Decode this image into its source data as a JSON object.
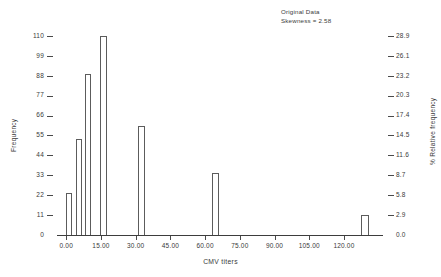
{
  "chart_data": {
    "type": "bar",
    "title": "",
    "annotation": {
      "line1": "Original Data",
      "line2": "Skewness = 2.58"
    },
    "xlabel": "CMV titers",
    "ylabel": "Frequency",
    "ylabel_right": "% Relative frequency",
    "xlim": [
      -4,
      136
    ],
    "ylim": [
      0,
      115.5
    ],
    "grid": false,
    "legend": null,
    "bar_edge_color": "#5c5c5c",
    "bar_fill_color": "#ffffff",
    "axis_color": "#3d3d3d",
    "text_color": "#3a3a3a",
    "x_ticks": [
      {
        "value": 0,
        "label": "0.00"
      },
      {
        "value": 15,
        "label": "15.00"
      },
      {
        "value": 30,
        "label": "30.00"
      },
      {
        "value": 45,
        "label": "45.00"
      },
      {
        "value": 60,
        "label": "60.00"
      },
      {
        "value": 75,
        "label": "75.00"
      },
      {
        "value": 90,
        "label": "90.00"
      },
      {
        "value": 105,
        "label": "105.00"
      },
      {
        "value": 120,
        "label": "120.00"
      }
    ],
    "y_ticks_left": [
      {
        "value": 0,
        "label": "0"
      },
      {
        "value": 11,
        "label": "11"
      },
      {
        "value": 22,
        "label": "22"
      },
      {
        "value": 33,
        "label": "33"
      },
      {
        "value": 44,
        "label": "44"
      },
      {
        "value": 55,
        "label": "55"
      },
      {
        "value": 66,
        "label": "66"
      },
      {
        "value": 77,
        "label": "77"
      },
      {
        "value": 88,
        "label": "88"
      },
      {
        "value": 99,
        "label": "99"
      },
      {
        "value": 110,
        "label": "110"
      }
    ],
    "y_ticks_right": [
      {
        "value": 0,
        "label": "0.0"
      },
      {
        "value": 11,
        "label": "2.9"
      },
      {
        "value": 22,
        "label": "5.8"
      },
      {
        "value": 33,
        "label": "8.7"
      },
      {
        "value": 44,
        "label": "11.6"
      },
      {
        "value": 55,
        "label": "14.5"
      },
      {
        "value": 66,
        "label": "17.4"
      },
      {
        "value": 77,
        "label": "20.3"
      },
      {
        "value": 88,
        "label": "23.2"
      },
      {
        "value": 99,
        "label": "26.1"
      },
      {
        "value": 110,
        "label": "28.9"
      }
    ],
    "bars": [
      {
        "x": 0.0,
        "width": 2.6,
        "value": 23,
        "relative_frequency": 6.1
      },
      {
        "x": 4.4,
        "width": 2.6,
        "value": 53,
        "relative_frequency": 13.9
      },
      {
        "x": 7.9,
        "width": 2.6,
        "value": 89,
        "relative_frequency": 23.4
      },
      {
        "x": 14.6,
        "width": 2.9,
        "value": 110,
        "relative_frequency": 28.9
      },
      {
        "x": 31.0,
        "width": 2.9,
        "value": 60,
        "relative_frequency": 15.8
      },
      {
        "x": 63.0,
        "width": 2.9,
        "value": 34,
        "relative_frequency": 8.9
      },
      {
        "x": 127.5,
        "width": 3.2,
        "value": 11,
        "relative_frequency": 2.9
      }
    ]
  }
}
